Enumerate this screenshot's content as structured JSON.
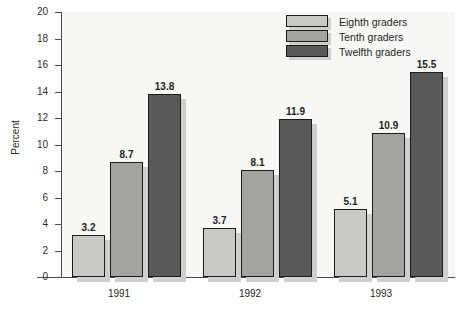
{
  "chart_data": {
    "type": "bar",
    "title": "",
    "xlabel": "",
    "ylabel": "Percent",
    "ylim": [
      0,
      20
    ],
    "ytick_step": 2,
    "yticks": [
      "20",
      "18",
      "16",
      "14",
      "12",
      "10",
      "8",
      "6",
      "4",
      "2",
      "0"
    ],
    "categories": [
      "1991",
      "1992",
      "1993"
    ],
    "grid": false,
    "legend_position": "top-right",
    "series": [
      {
        "name": "Eighth graders",
        "color": "#c9c9c7",
        "values": [
          3.2,
          3.7,
          5.1
        ],
        "labels": [
          "3.2",
          "3.7",
          "5.1"
        ]
      },
      {
        "name": "Tenth graders",
        "color": "#a3a3a1",
        "values": [
          8.7,
          8.1,
          10.9
        ],
        "labels": [
          "8.7",
          "8.1",
          "10.9"
        ]
      },
      {
        "name": "Twelfth graders",
        "color": "#595959",
        "values": [
          13.8,
          11.9,
          15.5
        ],
        "labels": [
          "13.8",
          "11.9",
          "15.5"
        ]
      }
    ]
  },
  "axis": {
    "y_title": "Percent"
  },
  "legend": {
    "items": [
      {
        "label": "Eighth graders",
        "color": "#c9c9c7"
      },
      {
        "label": "Tenth graders",
        "color": "#a3a3a1"
      },
      {
        "label": "Twelfth graders",
        "color": "#595959"
      }
    ]
  },
  "colors": {
    "plot_background": "#f7f7f5",
    "page_background": "#ffffff",
    "axis": "#4a4a4a",
    "bar_outline": "#1c1c1c",
    "shadow": "#cfcfcd",
    "text": "#1f1f1f"
  }
}
